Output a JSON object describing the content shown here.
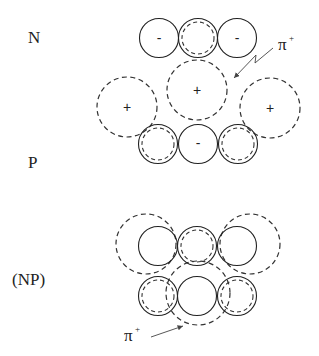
{
  "labels": {
    "n": "N",
    "p": "P",
    "np": "(NP)"
  },
  "signs": {
    "minus": "-",
    "plus": "+"
  },
  "pion": {
    "symbol": "π",
    "charge": "+"
  },
  "diagram": {
    "n_row": [
      {
        "type": "solid",
        "sign": "-"
      },
      {
        "type": "solid-with-inner-dashed",
        "sign": ""
      },
      {
        "type": "solid",
        "sign": "-"
      }
    ],
    "pion_cloud": [
      {
        "type": "dashed",
        "sign": "+"
      },
      {
        "type": "dashed",
        "sign": "+"
      },
      {
        "type": "dashed",
        "sign": "+"
      }
    ],
    "p_row": [
      {
        "type": "solid-with-inner-dashed",
        "sign": ""
      },
      {
        "type": "solid",
        "sign": "-"
      },
      {
        "type": "solid-with-inner-dashed",
        "sign": ""
      }
    ],
    "np_top_row": [
      {
        "type": "solid"
      },
      {
        "type": "solid-with-inner-dashed"
      },
      {
        "type": "solid"
      }
    ],
    "np_bottom_row": [
      {
        "type": "solid-with-inner-dashed"
      },
      {
        "type": "solid"
      },
      {
        "type": "solid-with-inner-dashed"
      }
    ]
  }
}
